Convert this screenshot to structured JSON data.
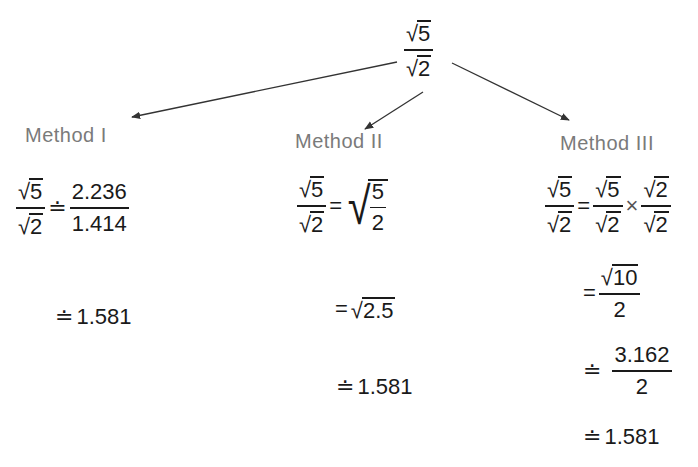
{
  "root": {
    "numerator": "5",
    "denominator": "2",
    "radical": "√"
  },
  "methods": [
    {
      "label": "Method I",
      "steps": {
        "s1_left_num": "5",
        "s1_left_den": "2",
        "s1_rel": "≐",
        "s1_right_num": "2.236",
        "s1_right_den": "1.414",
        "s2_rel": "≐",
        "s2_value": "1.581"
      }
    },
    {
      "label": "Method II",
      "steps": {
        "s1_left_num": "5",
        "s1_left_den": "2",
        "s1_rel": "=",
        "s1_right_num": "5",
        "s1_right_den": "2",
        "s2_rel": "=",
        "s2_value": "2.5",
        "s3_rel": "≐",
        "s3_value": "1.581"
      }
    },
    {
      "label": "Method III",
      "steps": {
        "s1_left_num": "5",
        "s1_left_den": "2",
        "s1_rel": "=",
        "s1_mid_num": "5",
        "s1_mid_den": "2",
        "s1_op": "×",
        "s1_right_num": "2",
        "s1_right_den": "2",
        "s2_rel": "=",
        "s2_num": "10",
        "s2_den": "2",
        "s3_rel": "≐",
        "s3_num": "3.162",
        "s3_den": "2",
        "s4_rel": "≐",
        "s4_value": "1.581"
      }
    }
  ],
  "colors": {
    "text": "#1a1a1a",
    "label": "#7a7a7a",
    "arrow": "#333333"
  }
}
